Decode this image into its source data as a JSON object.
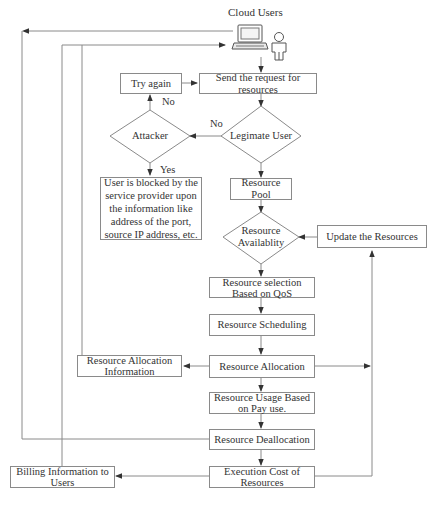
{
  "diagram": {
    "title": "Cloud Users",
    "nodes": {
      "try_again": "Try again",
      "send_request": "Send the request for resources",
      "attacker": "Attacker",
      "legitimate_user": "Legimate User",
      "blocked": "User is blocked by the service provider  upon the information like address of the port,  source IP address, etc.",
      "resource_pool": "Resource Pool",
      "resource_availability": "Resource Availablity",
      "update_resources": "Update the Resources",
      "resource_selection": "Resource selection Based on QoS",
      "resource_scheduling": "Resource Scheduling",
      "resource_allocation": "Resource Allocation",
      "resource_allocation_info": "Resource Allocation Information",
      "resource_usage": "Resource Usage Based on Pay use.",
      "resource_deallocation": "Resource Deallocation",
      "execution_cost": "Execution Cost of Resources",
      "billing_info": "Billing Information to Users"
    },
    "edge_labels": {
      "attacker_no": "No",
      "legit_no": "No",
      "attacker_yes": "Yes"
    },
    "icons": {
      "laptop": "laptop-icon",
      "user": "user-icon"
    },
    "colors": {
      "line": "#8a8a8a",
      "text": "#333333",
      "arrow": "#333333"
    }
  }
}
